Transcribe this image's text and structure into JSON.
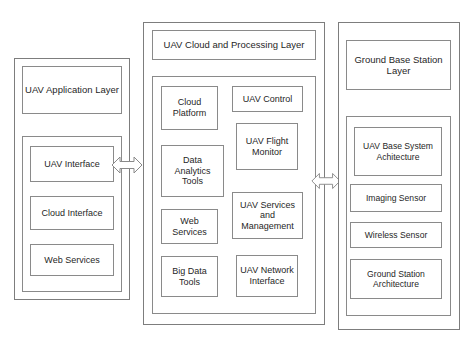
{
  "diagram": {
    "border_color": "#8a8a8a",
    "background_color": "#ffffff",
    "text_color": "#1f1f1f"
  },
  "application_panel": {
    "header": "UAV Application Layer",
    "items": [
      {
        "label": "UAV Interface"
      },
      {
        "label": "Cloud Interface"
      },
      {
        "label": "Web Services"
      }
    ]
  },
  "cloud_panel": {
    "header": "UAV Cloud and Processing Layer",
    "left_column": [
      {
        "label": "Cloud Platform"
      },
      {
        "label": "Data Analytics Tools"
      },
      {
        "label": "Web Services"
      },
      {
        "label": "Big Data Tools"
      }
    ],
    "right_column": [
      {
        "label": "UAV Control"
      },
      {
        "label": "UAV Flight Monitor"
      },
      {
        "label": "UAV Services and Management"
      },
      {
        "label": "UAV Network Interface"
      }
    ]
  },
  "ground_panel": {
    "header": "Ground Base Station Layer",
    "items": [
      {
        "label": "UAV Base System Achitecture"
      },
      {
        "label": "Imaging Sensor"
      },
      {
        "label": "Wireless Sensor"
      },
      {
        "label": "Ground Station Architecture"
      }
    ]
  },
  "connectors": [
    {
      "name": "application-to-cloud",
      "kind": "double-headed-arrow"
    },
    {
      "name": "cloud-to-ground",
      "kind": "double-headed-arrow"
    }
  ],
  "caption": {
    "text": ""
  }
}
